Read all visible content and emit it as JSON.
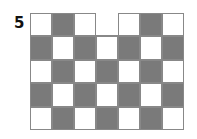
{
  "figure": {
    "label": "5",
    "cols": 7,
    "rows": 5,
    "colors": {
      "dark": "#7a7a7a",
      "light": "#ffffff",
      "border": "#888888"
    },
    "cells": [
      [
        "W",
        "D",
        "W",
        "X",
        "W",
        "D",
        "W"
      ],
      [
        "D",
        "W",
        "D",
        "W",
        "D",
        "W",
        "D"
      ],
      [
        "W",
        "D",
        "W",
        "D",
        "W",
        "D",
        "W"
      ],
      [
        "D",
        "W",
        "D",
        "W",
        "D",
        "W",
        "D"
      ],
      [
        "W",
        "D",
        "W",
        "D",
        "W",
        "D",
        "W"
      ]
    ]
  }
}
